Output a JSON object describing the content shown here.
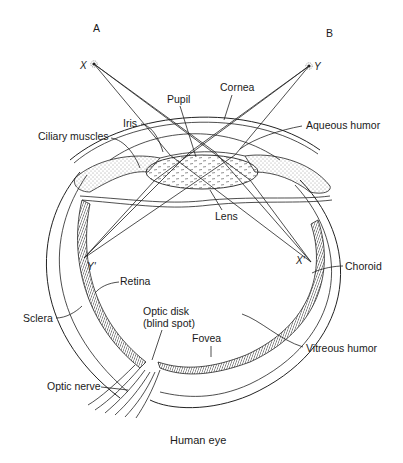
{
  "diagram": {
    "title": "Human eye",
    "viewpoints": {
      "left": "A",
      "right": "B"
    },
    "points": {
      "object_x": "X",
      "object_y": "Y",
      "image_x": "X'",
      "image_y": "Y'"
    },
    "labels": {
      "cornea": "Cornea",
      "pupil": "Pupil",
      "iris": "Iris",
      "aqueous_humor": "Aqueous humor",
      "ciliary_muscles": "Ciliary muscles",
      "lens": "Lens",
      "choroid": "Choroid",
      "retina": "Retina",
      "sclera": "Sclera",
      "optic_disk": "Optic disk",
      "blind_spot": "(blind spot)",
      "fovea": "Fovea",
      "vitreous_humor": "Vitreous humor",
      "optic_nerve": "Optic nerve"
    },
    "colors": {
      "ink": "#222222",
      "background": "#ffffff"
    }
  }
}
